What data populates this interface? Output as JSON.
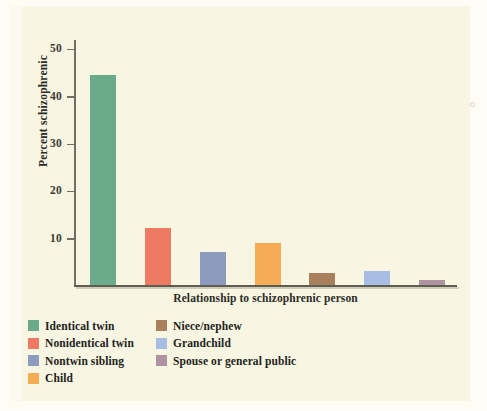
{
  "chart_data": {
    "type": "bar",
    "title": "",
    "xlabel": "Relationship to schizophrenic person",
    "ylabel": "Percent schizophrenic",
    "categories": [
      "Identical twin",
      "Nonidentical twin",
      "Nontwin sibling",
      "Child",
      "Niece/nephew",
      "Grandchild",
      "Spouse or general public"
    ],
    "values": [
      44.5,
      12,
      7,
      9,
      2.5,
      3,
      1
    ],
    "colors": [
      "#6aab8a",
      "#ef7a63",
      "#8d9cbe",
      "#f5ac55",
      "#a8805c",
      "#a8bce4",
      "#b093a0"
    ],
    "ylim": [
      0,
      52
    ],
    "yticks": [
      10,
      20,
      30,
      40,
      50
    ],
    "ytick_labels": [
      "10",
      "20",
      "30",
      "40",
      "50"
    ],
    "grid": false,
    "legend_position": "below-axis"
  },
  "axis": {
    "y_title": "Percent schizophrenic",
    "x_title": "Relationship to schizophrenic person",
    "ticks": [
      {
        "label": "50",
        "value": 50
      },
      {
        "label": "40",
        "value": 40
      },
      {
        "label": "30",
        "value": 30
      },
      {
        "label": "20",
        "value": 20
      },
      {
        "label": "10",
        "value": 10
      }
    ]
  },
  "legend": {
    "left_column": [
      {
        "label": "Identical twin",
        "color": "#6aab8a"
      },
      {
        "label": "Nonidentical twin",
        "color": "#ef7a63"
      },
      {
        "label": "Nontwin sibling",
        "color": "#8d9cbe"
      },
      {
        "label": "Child",
        "color": "#f5ac55"
      }
    ],
    "right_column": [
      {
        "label": "Niece/nephew",
        "color": "#a8805c"
      },
      {
        "label": "Grandchild",
        "color": "#a8bce4"
      },
      {
        "label": "Spouse or general public",
        "color": "#b093a0"
      }
    ]
  },
  "palette": {
    "background": "#f8f6e2",
    "page_edge": "#fbfaf0",
    "axis": "#5d5d52",
    "text": "#22221c"
  }
}
